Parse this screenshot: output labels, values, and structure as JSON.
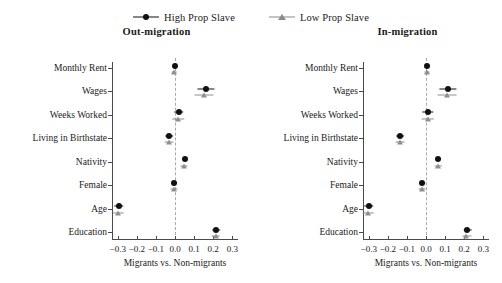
{
  "legend": {
    "entries": [
      {
        "label": "High Prop Slave",
        "marker": "circle-marker",
        "color": "#111111"
      },
      {
        "label": "Low Prop Slave",
        "marker": "triangle-marker",
        "color": "#8f8f8f"
      }
    ]
  },
  "axis": {
    "xlabel": "Migrants vs. Non-migrants",
    "ticks": [
      "-0.3",
      "-0.2",
      "-0.1",
      "0.0",
      "0.1",
      "0.2",
      "0.3"
    ],
    "tick_values": [
      -0.3,
      -0.2,
      -0.1,
      0.0,
      0.1,
      0.2,
      0.3
    ],
    "xlim": [
      -0.33,
      0.33
    ],
    "zero_reference": 0.0
  },
  "categories": [
    "Monthly Rent",
    "Wages",
    "Weeks Worked",
    "Living in Birthstate",
    "Nativity",
    "Female",
    "Age",
    "Education"
  ],
  "panels": [
    {
      "id": "out-migration",
      "title": "Out-migration"
    },
    {
      "id": "in-migration",
      "title": "In-migration"
    }
  ],
  "chart_data": {
    "type": "scatter",
    "title": "",
    "xlabel": "Migrants vs. Non-migrants",
    "ylabel": "",
    "xlim": [
      -0.33,
      0.33
    ],
    "grid": false,
    "legend_position": "top-center",
    "zero_line": 0.0,
    "categories": [
      "Monthly Rent",
      "Wages",
      "Weeks Worked",
      "Living in Birthstate",
      "Nativity",
      "Female",
      "Age",
      "Education"
    ],
    "panels": [
      {
        "title": "Out-migration",
        "series": [
          {
            "name": "High Prop Slave",
            "marker": "circle",
            "color": "#111111",
            "values": [
              0.0,
              0.16,
              0.02,
              -0.03,
              0.05,
              -0.005,
              -0.295,
              0.215
            ],
            "ci_low": [
              -0.01,
              0.115,
              -0.005,
              -0.05,
              0.035,
              -0.02,
              -0.32,
              0.195
            ],
            "ci_high": [
              0.01,
              0.205,
              0.045,
              -0.01,
              0.065,
              0.01,
              -0.27,
              0.235
            ]
          },
          {
            "name": "Low Prop Slave",
            "marker": "triangle",
            "color": "#8f8f8f",
            "values": [
              -0.003,
              0.15,
              0.018,
              -0.032,
              0.048,
              -0.007,
              -0.297,
              0.213
            ],
            "ci_low": [
              -0.015,
              0.1,
              -0.012,
              -0.055,
              0.03,
              -0.025,
              -0.325,
              0.19
            ],
            "ci_high": [
              0.009,
              0.2,
              0.048,
              -0.009,
              0.066,
              0.011,
              -0.269,
              0.236
            ]
          }
        ]
      },
      {
        "title": "In-migration",
        "series": [
          {
            "name": "High Prop Slave",
            "marker": "circle",
            "color": "#111111",
            "values": [
              0.005,
              0.115,
              0.01,
              -0.135,
              0.065,
              -0.02,
              -0.3,
              0.215
            ],
            "ci_low": [
              -0.005,
              0.07,
              -0.02,
              -0.155,
              0.05,
              -0.035,
              -0.325,
              0.195
            ],
            "ci_high": [
              0.015,
              0.16,
              0.04,
              -0.115,
              0.08,
              -0.005,
              -0.275,
              0.24
            ]
          },
          {
            "name": "Low Prop Slave",
            "marker": "triangle",
            "color": "#8f8f8f",
            "values": [
              0.003,
              0.108,
              0.008,
              -0.137,
              0.063,
              -0.022,
              -0.302,
              0.212
            ],
            "ci_low": [
              -0.01,
              0.058,
              -0.025,
              -0.16,
              0.046,
              -0.04,
              -0.33,
              0.19
            ],
            "ci_high": [
              0.016,
              0.158,
              0.041,
              -0.114,
              0.08,
              -0.004,
              -0.274,
              0.238
            ]
          }
        ]
      }
    ]
  }
}
